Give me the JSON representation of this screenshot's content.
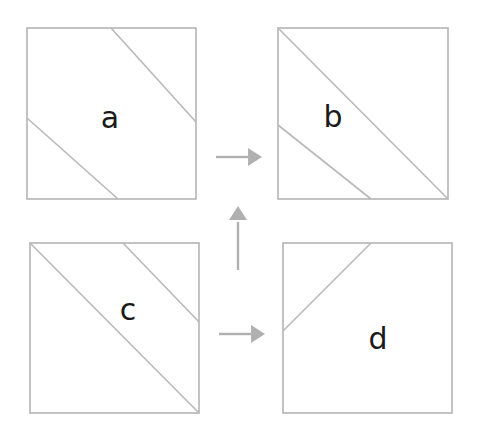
{
  "figure": {
    "canvas": {
      "width": 480,
      "height": 432,
      "background": "#ffffff"
    },
    "stroke_color": "#b9b9b9",
    "frame_color": "#b4b4b4",
    "arrow_color": "#b0b0b0",
    "label_color": "#1a1a1a"
  },
  "panels": [
    {
      "id": "a",
      "label": "a",
      "position": "top-left",
      "box": {
        "x": 27,
        "y": 28,
        "width": 169,
        "height": 171
      },
      "label_pos": {
        "x": 110,
        "y": 119
      },
      "lines": [
        {
          "name": "upper-diagonal",
          "x1": 111,
          "y1": 28,
          "x2": 196,
          "y2": 122
        },
        {
          "name": "lower-diagonal",
          "x1": 27,
          "y1": 118,
          "x2": 118,
          "y2": 199
        }
      ],
      "line_count": 2,
      "line_direction": "down-right"
    },
    {
      "id": "b",
      "label": "b",
      "position": "top-right",
      "box": {
        "x": 278,
        "y": 28,
        "width": 170,
        "height": 171
      },
      "label_pos": {
        "x": 333,
        "y": 118
      },
      "lines": [
        {
          "name": "main-diagonal",
          "x1": 278,
          "y1": 28,
          "x2": 448,
          "y2": 199
        },
        {
          "name": "offset-diagonal",
          "x1": 278,
          "y1": 125,
          "x2": 371,
          "y2": 199
        }
      ],
      "line_count": 2,
      "line_direction": "down-right"
    },
    {
      "id": "c",
      "label": "c",
      "position": "bottom-left",
      "box": {
        "x": 30,
        "y": 243,
        "width": 169,
        "height": 170
      },
      "label_pos": {
        "x": 128,
        "y": 311
      },
      "lines": [
        {
          "name": "main-diagonal",
          "x1": 30,
          "y1": 243,
          "x2": 199,
          "y2": 413
        },
        {
          "name": "offset-diagonal",
          "x1": 123,
          "y1": 243,
          "x2": 199,
          "y2": 322
        }
      ],
      "line_count": 2,
      "line_direction": "down-right"
    },
    {
      "id": "d",
      "label": "d",
      "position": "bottom-right",
      "box": {
        "x": 283,
        "y": 243,
        "width": 169,
        "height": 170
      },
      "label_pos": {
        "x": 378,
        "y": 340
      },
      "lines": [
        {
          "name": "corner-cut-diagonal",
          "x1": 283,
          "y1": 331,
          "x2": 371,
          "y2": 243
        }
      ],
      "line_count": 1,
      "line_direction": "up-right"
    }
  ],
  "arrows": [
    {
      "name": "arrow-a-to-b",
      "direction": "right",
      "from_panel": "a",
      "to_panel": "b",
      "shaft": {
        "x1": 216,
        "y1": 157,
        "x2": 248,
        "y2": 157
      },
      "head": {
        "tip_x": 262,
        "tip_y": 157,
        "size": 9
      }
    },
    {
      "name": "arrow-c-to-d",
      "direction": "right",
      "from_panel": "c",
      "to_panel": "d",
      "shaft": {
        "x1": 219,
        "y1": 334,
        "x2": 251,
        "y2": 334
      },
      "head": {
        "tip_x": 265,
        "tip_y": 334,
        "size": 9
      }
    },
    {
      "name": "arrow-c-to-a",
      "direction": "up",
      "from_panel": "c",
      "to_panel": "a",
      "shaft": {
        "x1": 238,
        "y1": 270,
        "x2": 238,
        "y2": 222
      },
      "head": {
        "tip_x": 238,
        "tip_y": 206,
        "size": 9
      }
    }
  ]
}
